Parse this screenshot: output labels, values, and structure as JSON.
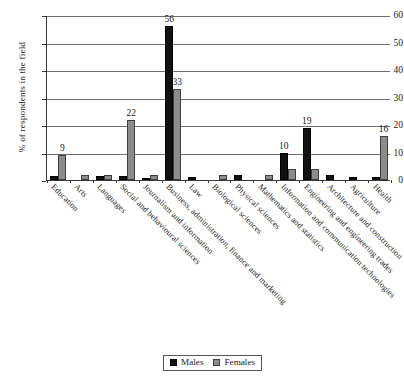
{
  "chart_data": {
    "type": "bar",
    "title": "",
    "subtitle": "",
    "xlabel": "",
    "ylabel": "% of respondents in the field",
    "ylim": [
      0,
      60
    ],
    "yticks": [
      0,
      10,
      20,
      30,
      40,
      50,
      60
    ],
    "grid": true,
    "legend_position": "bottom-center",
    "categories": [
      "Education",
      "Arts",
      "Languages",
      "Social and behavioural sciences",
      "Journalism and information",
      "Business, administration, finance and marketing",
      "Law",
      "Biological sciences",
      "Physical sciences",
      "Mathematics and statistics",
      "Information and communication technologies",
      "Engineering and engineering trades",
      "Architecture and construction",
      "Agriculture",
      "Health"
    ],
    "series": [
      {
        "name": "Males",
        "color": "#111111",
        "values": [
          1.5,
          0,
          1.5,
          1.5,
          0.7,
          56,
          1.2,
          0,
          2,
          0,
          10,
          19,
          2,
          1.2,
          1.2
        ]
      },
      {
        "name": "Females",
        "color": "#8c8c8c",
        "values": [
          9,
          2,
          2,
          22,
          2,
          33,
          0,
          2,
          0,
          2,
          4,
          4,
          0,
          0,
          16
        ]
      }
    ],
    "data_labels": [
      {
        "category_index": 0,
        "series": "Females",
        "text": "9"
      },
      {
        "category_index": 3,
        "series": "Females",
        "text": "22"
      },
      {
        "category_index": 5,
        "series": "Males",
        "text": "56"
      },
      {
        "category_index": 5,
        "series": "Females",
        "text": "33"
      },
      {
        "category_index": 10,
        "series": "Males",
        "text": "10"
      },
      {
        "category_index": 11,
        "series": "Males",
        "text": "19"
      },
      {
        "category_index": 14,
        "series": "Females",
        "text": "16"
      }
    ]
  },
  "legend": {
    "items": [
      {
        "label": "Males"
      },
      {
        "label": "Females"
      }
    ]
  }
}
